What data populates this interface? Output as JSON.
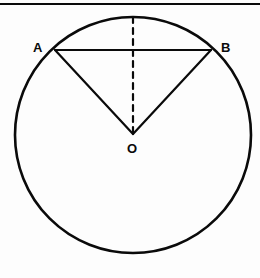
{
  "figure": {
    "background_color": "#fdfdfd",
    "stroke_color": "#0a0a0a",
    "top_rule": {
      "name": "top-horizontal-rule",
      "x1": 0,
      "y1": 4,
      "x2": 260,
      "y2": 4,
      "stroke_width": 2
    },
    "circle": {
      "name": "main-circle",
      "cx": 133,
      "cy": 135,
      "r": 118,
      "stroke_width": 2.6,
      "fill": "none"
    },
    "points": [
      {
        "id": "A",
        "label": "A",
        "x": 55,
        "y": 50,
        "label_x": 33,
        "label_y": 52
      },
      {
        "id": "B",
        "label": "B",
        "x": 211,
        "y": 50,
        "label_x": 221,
        "label_y": 52
      },
      {
        "id": "O",
        "label": "O",
        "x": 133,
        "y": 134,
        "label_x": 127,
        "label_y": 153
      }
    ],
    "segments": [
      {
        "name": "chord-ab",
        "from": "A",
        "to": "B",
        "x1": 55,
        "y1": 50,
        "x2": 211,
        "y2": 50,
        "style": "solid",
        "stroke_width": 2.2
      },
      {
        "name": "radius-oa",
        "from": "O",
        "to": "A",
        "x1": 133,
        "y1": 134,
        "x2": 55,
        "y2": 50,
        "style": "solid",
        "stroke_width": 2.2
      },
      {
        "name": "radius-ob",
        "from": "O",
        "to": "B",
        "x1": 133,
        "y1": 134,
        "x2": 211,
        "y2": 50,
        "style": "solid",
        "stroke_width": 2.2
      },
      {
        "name": "dashed-vertical-axis",
        "from": "top-of-circle",
        "to": "O",
        "x1": 133,
        "y1": 17,
        "x2": 133,
        "y2": 134,
        "style": "dashed",
        "dash_pattern": "6,5",
        "stroke_width": 2.2
      }
    ]
  }
}
